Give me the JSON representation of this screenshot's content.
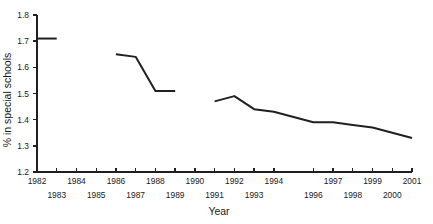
{
  "chart_data": {
    "type": "line",
    "title": "",
    "xlabel": "Year",
    "ylabel": "% in special schools",
    "xlim": [
      1982,
      2001
    ],
    "ylim": [
      1.2,
      1.8
    ],
    "grid": false,
    "legend": null,
    "y_ticks": [
      "1.8",
      "1.7",
      "1.6",
      "1.5",
      "1.4",
      "1.3",
      "1.2"
    ],
    "y_tick_values": [
      1.8,
      1.7,
      1.6,
      1.5,
      1.4,
      1.3,
      1.2
    ],
    "x_ticks_top": [
      "1982",
      "1984",
      "1986",
      "1988",
      "1990",
      "1992",
      "1994",
      "1997",
      "1999",
      "2001"
    ],
    "x_ticks_bottom": [
      "1983",
      "1985",
      "1987",
      "1989",
      "1991",
      "1993",
      "1996",
      "1998",
      "2000"
    ],
    "x_tick_values_top": [
      1982,
      1984,
      1986,
      1988,
      1990,
      1992,
      1994,
      1997,
      1999,
      2001
    ],
    "x_tick_values_bottom": [
      1983,
      1985,
      1987,
      1989,
      1991,
      1993,
      1996,
      1998,
      2000
    ],
    "series": [
      {
        "name": "% in special schools",
        "color": "#202020",
        "segments": [
          {
            "x": [
              1982,
              1983
            ],
            "y": [
              1.71,
              1.71
            ]
          },
          {
            "x": [
              1986,
              1987,
              1988,
              1989
            ],
            "y": [
              1.65,
              1.64,
              1.51,
              1.51
            ]
          },
          {
            "x": [
              1991,
              1992,
              1993,
              1994,
              1996,
              1997,
              1998,
              1999,
              2000,
              2001
            ],
            "y": [
              1.47,
              1.49,
              1.44,
              1.43,
              1.39,
              1.39,
              1.38,
              1.37,
              1.35,
              1.33
            ]
          }
        ]
      }
    ]
  },
  "axes": {
    "x_axis_name": "year-axis",
    "y_axis_name": "percent-axis"
  }
}
